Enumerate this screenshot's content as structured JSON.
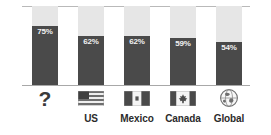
{
  "chart_data": {
    "type": "bar",
    "title": "",
    "subtitle": "",
    "xlabel": "",
    "ylabel": "",
    "ylim": [
      0,
      100
    ],
    "grid": false,
    "legend": "none",
    "stacked": true,
    "categories": [
      "?",
      "US",
      "Mexico",
      "Canada",
      "Global"
    ],
    "values": [
      75,
      62,
      62,
      59,
      54
    ],
    "value_labels": [
      "75%",
      "62%",
      "62%",
      "59%",
      "54%"
    ],
    "remainder_values": [
      25,
      38,
      38,
      41,
      46
    ],
    "series": [
      {
        "name": "filled",
        "values": [
          75,
          62,
          62,
          59,
          54
        ],
        "color": "#4a4a4a"
      },
      {
        "name": "remainder",
        "values": [
          25,
          38,
          38,
          41,
          46
        ],
        "color": "#e6e6e6"
      }
    ],
    "bars": [
      {
        "category": "?",
        "value": 75,
        "label": "75%",
        "icon": "question-mark-icon",
        "axis_label": ""
      },
      {
        "category": "US",
        "value": 62,
        "label": "62%",
        "icon": "flag-us-icon",
        "axis_label": "US"
      },
      {
        "category": "Mexico",
        "value": 62,
        "label": "62%",
        "icon": "flag-mexico-icon",
        "axis_label": "Mexico"
      },
      {
        "category": "Canada",
        "value": 59,
        "label": "59%",
        "icon": "flag-canada-icon",
        "axis_label": "Canada"
      },
      {
        "category": "Global",
        "value": 54,
        "label": "54%",
        "icon": "globe-icon",
        "axis_label": "Global"
      }
    ]
  },
  "colors": {
    "bar_fill": "#4a4a4a",
    "bar_remainder": "#e6e6e6",
    "value_text": "#f2f2f2",
    "axis_text": "#2b2b2b",
    "rule": "#b9b9b9",
    "baseline": "#a8a8a8",
    "background": "#ffffff"
  }
}
